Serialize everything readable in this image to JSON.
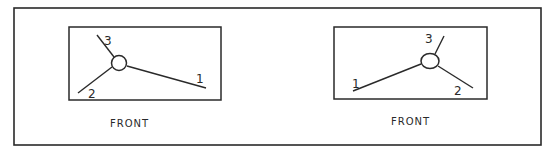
{
  "figure": {
    "colors": {
      "ink": "#2a2a2a",
      "background": "#ffffff"
    },
    "panels": [
      {
        "caption": "FRONT",
        "labels": {
          "one": "1",
          "two": "2",
          "three": "3"
        }
      },
      {
        "caption": "FRONT",
        "labels": {
          "one": "1",
          "two": "2",
          "three": "3"
        }
      }
    ]
  }
}
